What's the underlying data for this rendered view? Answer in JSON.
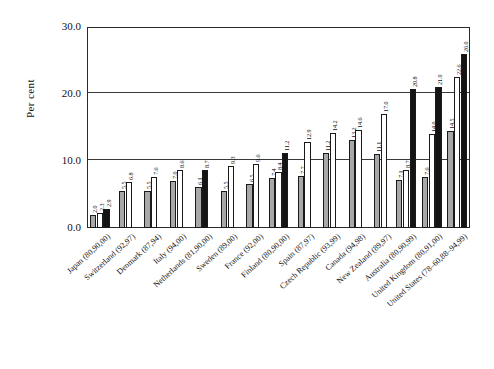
{
  "chart_data": {
    "type": "bar",
    "title": "",
    "subtitle": "",
    "xlabel": "",
    "ylabel": "Per cent",
    "ylim": [
      0,
      30
    ],
    "yticks": [
      "0.0",
      "10.0",
      "20.0",
      "30.0"
    ],
    "grid": "horizontal",
    "legend": "none",
    "series_styles": [
      "gray",
      "white",
      "black"
    ],
    "categories": [
      "Japan (80,90,00)",
      "Switzerland (92,97)",
      "Denmark (87,94)",
      "Italy (94,00)",
      "Netherlands (81,90,00)",
      "Sweden (89,00)",
      "France (92,00)",
      "Finland (80,90,00)",
      "Spain (87,97)",
      "Czech Republic (93,99)",
      "Canada (94,98)",
      "New Zealand (89,97)",
      "Australia (80,90,99)",
      "United Kingdom (80,91,00)",
      "United States (78–60,88–94,99)"
    ],
    "groups": [
      {
        "category": "Japan (80,90,00)",
        "bars": [
          {
            "value": 2.0,
            "label": "2.0",
            "style": "gray"
          },
          {
            "value": 2.3,
            "label": "2.3",
            "style": "white"
          },
          {
            "value": 2.9,
            "label": "2.9",
            "style": "black"
          }
        ]
      },
      {
        "category": "Switzerland (92,97)",
        "bars": [
          {
            "value": 5.5,
            "label": "5.5",
            "style": "gray"
          },
          {
            "value": 6.8,
            "label": "6.8",
            "style": "white"
          }
        ]
      },
      {
        "category": "Denmark (87,94)",
        "bars": [
          {
            "value": 5.5,
            "label": "5.5",
            "style": "gray"
          },
          {
            "value": 7.6,
            "label": "7.6",
            "style": "white"
          }
        ]
      },
      {
        "category": "Italy (94,00)",
        "bars": [
          {
            "value": 7.0,
            "label": "7.0",
            "style": "gray"
          },
          {
            "value": 8.6,
            "label": "8.6",
            "style": "white"
          }
        ]
      },
      {
        "category": "Netherlands (81,90,00)",
        "bars": [
          {
            "value": 6.1,
            "label": "6.1",
            "style": "gray"
          },
          {
            "value": 8.7,
            "label": "8.7",
            "style": "black"
          }
        ]
      },
      {
        "category": "Sweden (89,00)",
        "bars": [
          {
            "value": 5.5,
            "label": "5.5",
            "style": "gray"
          },
          {
            "value": 9.3,
            "label": "9.3",
            "style": "white"
          }
        ]
      },
      {
        "category": "France (92,00)",
        "bars": [
          {
            "value": 6.5,
            "label": "6.5",
            "style": "gray"
          },
          {
            "value": 9.6,
            "label": "9.6",
            "style": "white"
          }
        ]
      },
      {
        "category": "Finland (80,90,00)",
        "bars": [
          {
            "value": 7.4,
            "label": "7.4",
            "style": "gray"
          },
          {
            "value": 8.4,
            "label": "8.4",
            "style": "white"
          },
          {
            "value": 11.2,
            "label": "11.2",
            "style": "black"
          }
        ]
      },
      {
        "category": "Spain (87,97)",
        "bars": [
          {
            "value": 7.7,
            "label": "7.7",
            "style": "gray"
          },
          {
            "value": 12.9,
            "label": "12.9",
            "style": "white"
          }
        ]
      },
      {
        "category": "Czech Republic (93,99)",
        "bars": [
          {
            "value": 11.2,
            "label": "11.2",
            "style": "gray"
          },
          {
            "value": 14.2,
            "label": "14.2",
            "style": "white"
          }
        ]
      },
      {
        "category": "Canada (94,98)",
        "bars": [
          {
            "value": 13.2,
            "label": "13.2",
            "style": "gray"
          },
          {
            "value": 14.6,
            "label": "14.6",
            "style": "white"
          }
        ]
      },
      {
        "category": "New Zealand (89,97)",
        "bars": [
          {
            "value": 11.1,
            "label": "11.1",
            "style": "gray"
          },
          {
            "value": 17.0,
            "label": "17.0",
            "style": "white"
          }
        ]
      },
      {
        "category": "Australia (80,90,99)",
        "bars": [
          {
            "value": 7.1,
            "label": "7.1",
            "style": "gray"
          },
          {
            "value": 8.7,
            "label": "8.7",
            "style": "white"
          },
          {
            "value": 20.8,
            "label": "20.8",
            "style": "black"
          }
        ]
      },
      {
        "category": "United Kingdom (80,91,00)",
        "bars": [
          {
            "value": 7.6,
            "label": "7.6",
            "style": "gray"
          },
          {
            "value": 14.0,
            "label": "14.0",
            "style": "white"
          },
          {
            "value": 21.0,
            "label": "21.0",
            "style": "black"
          }
        ]
      },
      {
        "category": "United States (78–60,88–94,99)",
        "bars": [
          {
            "value": 14.5,
            "label": "14.5",
            "style": "gray"
          },
          {
            "value": 22.6,
            "label": "22.6",
            "style": "white"
          },
          {
            "value": 26.0,
            "label": "26.0",
            "style": "black"
          }
        ]
      }
    ]
  }
}
